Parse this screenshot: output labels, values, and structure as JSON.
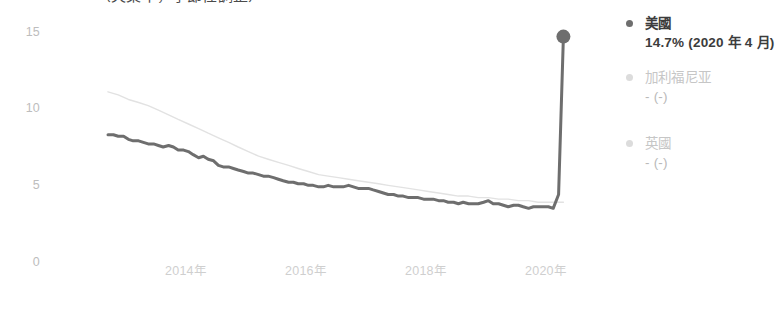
{
  "title_partial": "（失業率，季節性調整）",
  "legend": {
    "items": [
      {
        "name": "美國",
        "value": "14.7% (2020 年 4 月)",
        "bullet": "bullet-icon",
        "color": "#6e6e6e",
        "active": true
      },
      {
        "name": "加利福尼亚",
        "value": "- (-)",
        "bullet": "bullet-icon",
        "color": "#dcdcdc",
        "active": false
      },
      {
        "name": "英國",
        "value": "- (-)",
        "bullet": "bullet-icon",
        "color": "#dcdcdc",
        "active": false
      }
    ]
  },
  "chart_data": {
    "type": "line",
    "title": "",
    "xlabel": "",
    "ylabel": "",
    "ylim": [
      0,
      16
    ],
    "yticks": [
      0,
      5,
      10,
      15
    ],
    "ytick_labels": [
      "0",
      "5",
      "10",
      "15"
    ],
    "xticks": [
      "2014年",
      "2016年",
      "2018年",
      "2020年"
    ],
    "xtick_years": [
      2014,
      2016,
      2018,
      2020
    ],
    "xlim": [
      2012.7,
      2020.35
    ],
    "grid": false,
    "legend_position": "right",
    "annotations": [
      {
        "text": "14.7% (2020 年 4 月)",
        "x": 2020.29,
        "y": 14.7,
        "marker": true
      }
    ],
    "series": [
      {
        "name": "美國",
        "color": "#6e6e6e",
        "width": 3,
        "end_marker": true,
        "x": [
          2012.7,
          2012.79,
          2012.87,
          2012.96,
          2013.04,
          2013.12,
          2013.21,
          2013.29,
          2013.37,
          2013.46,
          2013.54,
          2013.62,
          2013.71,
          2013.79,
          2013.87,
          2013.96,
          2014.04,
          2014.12,
          2014.21,
          2014.29,
          2014.37,
          2014.46,
          2014.54,
          2014.62,
          2014.71,
          2014.79,
          2014.87,
          2014.96,
          2015.04,
          2015.12,
          2015.21,
          2015.29,
          2015.37,
          2015.46,
          2015.54,
          2015.62,
          2015.71,
          2015.79,
          2015.87,
          2015.96,
          2016.04,
          2016.12,
          2016.21,
          2016.29,
          2016.37,
          2016.46,
          2016.54,
          2016.62,
          2016.71,
          2016.79,
          2016.87,
          2016.96,
          2017.04,
          2017.12,
          2017.21,
          2017.29,
          2017.37,
          2017.46,
          2017.54,
          2017.62,
          2017.71,
          2017.79,
          2017.87,
          2017.96,
          2018.04,
          2018.12,
          2018.21,
          2018.29,
          2018.37,
          2018.46,
          2018.54,
          2018.62,
          2018.71,
          2018.79,
          2018.87,
          2018.96,
          2019.04,
          2019.12,
          2019.21,
          2019.29,
          2019.37,
          2019.46,
          2019.54,
          2019.62,
          2019.71,
          2019.79,
          2019.87,
          2019.96,
          2020.04,
          2020.12,
          2020.21,
          2020.29
        ],
        "y": [
          8.3,
          8.3,
          8.2,
          8.2,
          8.0,
          7.9,
          7.9,
          7.8,
          7.7,
          7.7,
          7.6,
          7.5,
          7.6,
          7.5,
          7.3,
          7.3,
          7.2,
          7.0,
          6.8,
          6.9,
          6.7,
          6.6,
          6.3,
          6.2,
          6.2,
          6.1,
          6.0,
          5.9,
          5.8,
          5.8,
          5.7,
          5.6,
          5.6,
          5.5,
          5.4,
          5.3,
          5.2,
          5.2,
          5.1,
          5.1,
          5.0,
          5.0,
          4.9,
          4.9,
          5.0,
          4.9,
          4.9,
          4.9,
          5.0,
          4.9,
          4.8,
          4.8,
          4.8,
          4.7,
          4.6,
          4.5,
          4.4,
          4.4,
          4.3,
          4.3,
          4.2,
          4.2,
          4.2,
          4.1,
          4.1,
          4.1,
          4.0,
          4.0,
          3.9,
          3.9,
          3.8,
          3.9,
          3.8,
          3.8,
          3.8,
          3.9,
          4.0,
          3.8,
          3.8,
          3.7,
          3.6,
          3.7,
          3.7,
          3.6,
          3.5,
          3.6,
          3.6,
          3.6,
          3.6,
          3.5,
          4.4,
          14.7
        ]
      },
      {
        "name": "comparison-line",
        "color": "#e2e2e2",
        "width": 1.4,
        "end_marker": false,
        "x": [
          2012.7,
          2012.87,
          2013.04,
          2013.21,
          2013.37,
          2013.54,
          2013.71,
          2013.87,
          2014.04,
          2014.21,
          2014.37,
          2014.54,
          2014.71,
          2014.87,
          2015.04,
          2015.21,
          2015.37,
          2015.54,
          2015.71,
          2015.87,
          2016.04,
          2016.21,
          2016.37,
          2016.54,
          2016.71,
          2016.87,
          2017.04,
          2017.21,
          2017.37,
          2017.54,
          2017.71,
          2017.87,
          2018.04,
          2018.21,
          2018.37,
          2018.54,
          2018.71,
          2018.87,
          2019.04,
          2019.21,
          2019.37,
          2019.54,
          2019.71,
          2019.87,
          2020.04,
          2020.21,
          2020.29
        ],
        "y": [
          11.1,
          10.9,
          10.6,
          10.4,
          10.2,
          9.9,
          9.6,
          9.3,
          9.0,
          8.7,
          8.4,
          8.1,
          7.8,
          7.5,
          7.2,
          6.9,
          6.7,
          6.5,
          6.3,
          6.1,
          5.9,
          5.7,
          5.6,
          5.5,
          5.4,
          5.3,
          5.2,
          5.1,
          5.0,
          4.9,
          4.8,
          4.7,
          4.6,
          4.5,
          4.4,
          4.3,
          4.3,
          4.2,
          4.2,
          4.1,
          4.1,
          4.0,
          4.0,
          3.9,
          3.9,
          3.9,
          3.9
        ]
      }
    ]
  }
}
